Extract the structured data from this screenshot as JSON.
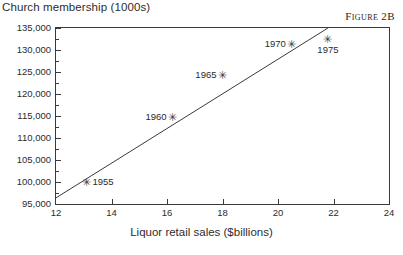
{
  "figure": {
    "caption": "Figure 2B",
    "ylabel": "Church membership (1000s)",
    "xlabel": "Liquor retail sales ($billions)"
  },
  "chart_data": {
    "type": "scatter",
    "title": "",
    "xlabel": "Liquor retail sales ($billions)",
    "ylabel": "Church membership (1000s)",
    "xlim": [
      12,
      24
    ],
    "ylim": [
      95000,
      135000
    ],
    "xticks": [
      12,
      14,
      16,
      18,
      20,
      22,
      24
    ],
    "xticklabels": [
      "12",
      "14",
      "16",
      "18",
      "20",
      "22",
      "24"
    ],
    "yticks": [
      95000,
      100000,
      105000,
      110000,
      115000,
      120000,
      125000,
      130000,
      135000
    ],
    "yticklabels": [
      "95,000",
      "100,000",
      "105,000",
      "110,000",
      "115,000",
      "120,000",
      "125,000",
      "130,000",
      "135,000"
    ],
    "grid": false,
    "legend": false,
    "marker": "asterisk",
    "points": [
      {
        "label": "1955",
        "x": 13.1,
        "y": 100100,
        "label_pos": "right"
      },
      {
        "label": "1960",
        "x": 16.2,
        "y": 114700,
        "label_pos": "left"
      },
      {
        "label": "1965",
        "x": 18.0,
        "y": 124400,
        "label_pos": "left"
      },
      {
        "label": "1970",
        "x": 20.5,
        "y": 131300,
        "label_pos": "left"
      },
      {
        "label": "1975",
        "x": 21.8,
        "y": 132400,
        "label_pos": "below"
      }
    ],
    "trendline": {
      "type": "line",
      "x": [
        12.0,
        21.8
      ],
      "y": [
        96400,
        135000
      ]
    },
    "colors": {
      "axis": "#3a3a3a",
      "marker": "#3a3a3a",
      "line": "#3a3a3a",
      "text": "#2b2b2b",
      "background": "#ffffff"
    }
  }
}
